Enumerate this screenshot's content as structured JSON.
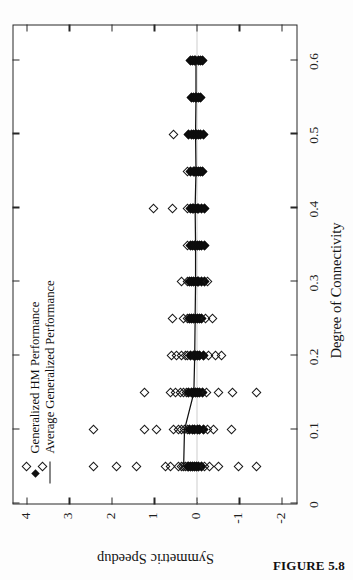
{
  "figure": {
    "caption": "FIGURE 5.8",
    "rotation_degrees": -90
  },
  "chart_data": {
    "type": "scatter",
    "title": "",
    "xlabel": "Degree of Connectivity",
    "ylabel": "Symmetric Speedup",
    "xlim": [
      0,
      0.65
    ],
    "ylim": [
      -2.4,
      4.3
    ],
    "xticks": [
      0,
      0.1,
      0.2,
      0.3,
      0.4,
      0.5,
      0.6
    ],
    "xtick_labels": [
      "0",
      "0.1",
      "0.2",
      "0.3",
      "0.4",
      "0.5",
      "0.6"
    ],
    "yticks": [
      4,
      3,
      2,
      1,
      0,
      -1,
      -2
    ],
    "ytick_labels": [
      "4",
      "3",
      "2",
      "1",
      "0",
      "-1",
      "-2"
    ],
    "grid": false,
    "zero_reference_line": true,
    "legend_position": "top-left",
    "legend": [
      {
        "name": "Generalized HM Performance",
        "marker": "diamond"
      },
      {
        "name": "Average Generalized Performance",
        "marker": "line"
      }
    ],
    "series": [
      {
        "name": "Generalized HM Performance",
        "marker": "diamond",
        "points": [
          [
            0.05,
            4.0
          ],
          [
            0.05,
            3.62
          ],
          [
            0.05,
            2.42
          ],
          [
            0.05,
            1.88
          ],
          [
            0.05,
            1.4
          ],
          [
            0.05,
            0.72
          ],
          [
            0.05,
            0.6
          ],
          [
            0.05,
            0.42
          ],
          [
            0.05,
            0.36
          ],
          [
            0.05,
            0.3
          ],
          [
            0.05,
            0.26
          ],
          [
            0.05,
            0.22
          ],
          [
            0.05,
            0.18
          ],
          [
            0.05,
            0.14
          ],
          [
            0.05,
            0.1
          ],
          [
            0.05,
            0.05
          ],
          [
            0.05,
            0.0
          ],
          [
            0.05,
            -0.05
          ],
          [
            0.05,
            -0.12
          ],
          [
            0.05,
            -0.2
          ],
          [
            0.05,
            -0.3
          ],
          [
            0.05,
            -0.52
          ],
          [
            0.05,
            -0.98
          ],
          [
            0.05,
            -1.42
          ],
          [
            0.1,
            2.42
          ],
          [
            0.1,
            1.22
          ],
          [
            0.1,
            0.94
          ],
          [
            0.1,
            0.55
          ],
          [
            0.1,
            0.42
          ],
          [
            0.1,
            0.34
          ],
          [
            0.1,
            0.28
          ],
          [
            0.1,
            0.22
          ],
          [
            0.1,
            0.16
          ],
          [
            0.1,
            0.1
          ],
          [
            0.1,
            0.04
          ],
          [
            0.1,
            -0.02
          ],
          [
            0.1,
            -0.08
          ],
          [
            0.1,
            -0.16
          ],
          [
            0.1,
            -0.26
          ],
          [
            0.1,
            -0.4
          ],
          [
            0.1,
            -0.82
          ],
          [
            0.15,
            1.22
          ],
          [
            0.15,
            0.62
          ],
          [
            0.15,
            0.5
          ],
          [
            0.15,
            0.38
          ],
          [
            0.15,
            0.3
          ],
          [
            0.15,
            0.24
          ],
          [
            0.15,
            0.18
          ],
          [
            0.15,
            0.12
          ],
          [
            0.15,
            0.06
          ],
          [
            0.15,
            0.02
          ],
          [
            0.15,
            -0.02
          ],
          [
            0.15,
            -0.08
          ],
          [
            0.15,
            -0.14
          ],
          [
            0.15,
            -0.24
          ],
          [
            0.15,
            -0.52
          ],
          [
            0.15,
            -0.86
          ],
          [
            0.15,
            -1.42
          ],
          [
            0.2,
            0.58
          ],
          [
            0.2,
            0.46
          ],
          [
            0.2,
            0.34
          ],
          [
            0.2,
            0.26
          ],
          [
            0.2,
            0.2
          ],
          [
            0.2,
            0.14
          ],
          [
            0.2,
            0.08
          ],
          [
            0.2,
            0.03
          ],
          [
            0.2,
            -0.02
          ],
          [
            0.2,
            -0.08
          ],
          [
            0.2,
            -0.16
          ],
          [
            0.2,
            -0.28
          ],
          [
            0.2,
            -0.44
          ],
          [
            0.2,
            -0.58
          ],
          [
            0.25,
            0.56
          ],
          [
            0.25,
            0.3
          ],
          [
            0.25,
            0.22
          ],
          [
            0.25,
            0.16
          ],
          [
            0.25,
            0.11
          ],
          [
            0.25,
            0.06
          ],
          [
            0.25,
            0.02
          ],
          [
            0.25,
            -0.02
          ],
          [
            0.25,
            -0.07
          ],
          [
            0.25,
            -0.13
          ],
          [
            0.25,
            -0.22
          ],
          [
            0.25,
            -0.38
          ],
          [
            0.3,
            0.36
          ],
          [
            0.3,
            0.22
          ],
          [
            0.3,
            0.16
          ],
          [
            0.3,
            0.11
          ],
          [
            0.3,
            0.06
          ],
          [
            0.3,
            0.02
          ],
          [
            0.3,
            -0.02
          ],
          [
            0.3,
            -0.06
          ],
          [
            0.3,
            -0.12
          ],
          [
            0.3,
            -0.18
          ],
          [
            0.3,
            -0.26
          ],
          [
            0.35,
            0.22
          ],
          [
            0.35,
            0.14
          ],
          [
            0.35,
            0.09
          ],
          [
            0.35,
            0.05
          ],
          [
            0.35,
            0.01
          ],
          [
            0.35,
            -0.03
          ],
          [
            0.35,
            -0.07
          ],
          [
            0.35,
            -0.12
          ],
          [
            0.35,
            -0.18
          ],
          [
            0.4,
            1.02
          ],
          [
            0.4,
            0.56
          ],
          [
            0.4,
            0.22
          ],
          [
            0.4,
            0.15
          ],
          [
            0.4,
            0.1
          ],
          [
            0.4,
            0.06
          ],
          [
            0.4,
            0.02
          ],
          [
            0.4,
            -0.02
          ],
          [
            0.4,
            -0.06
          ],
          [
            0.4,
            -0.11
          ],
          [
            0.4,
            -0.18
          ],
          [
            0.45,
            0.2
          ],
          [
            0.45,
            0.13
          ],
          [
            0.45,
            0.08
          ],
          [
            0.45,
            0.04
          ],
          [
            0.45,
            0.0
          ],
          [
            0.45,
            -0.04
          ],
          [
            0.45,
            -0.09
          ],
          [
            0.45,
            -0.14
          ],
          [
            0.5,
            0.55
          ],
          [
            0.5,
            0.18
          ],
          [
            0.5,
            0.12
          ],
          [
            0.5,
            0.07
          ],
          [
            0.5,
            0.03
          ],
          [
            0.5,
            -0.01
          ],
          [
            0.5,
            -0.05
          ],
          [
            0.5,
            -0.1
          ],
          [
            0.5,
            -0.16
          ],
          [
            0.55,
            0.12
          ],
          [
            0.55,
            0.07
          ],
          [
            0.55,
            0.03
          ],
          [
            0.55,
            -0.01
          ],
          [
            0.55,
            -0.05
          ],
          [
            0.55,
            -0.1
          ],
          [
            0.6,
            0.14
          ],
          [
            0.6,
            0.09
          ],
          [
            0.6,
            0.05
          ],
          [
            0.6,
            0.01
          ],
          [
            0.6,
            -0.04
          ],
          [
            0.6,
            -0.09
          ],
          [
            0.6,
            -0.14
          ]
        ]
      },
      {
        "name": "Average Generalized Performance",
        "marker": "line",
        "x": [
          0.05,
          0.1,
          0.15,
          0.2,
          0.25,
          0.3,
          0.35,
          0.4,
          0.45,
          0.5,
          0.55,
          0.6
        ],
        "values": [
          0.3,
          0.28,
          0.06,
          0.04,
          0.03,
          0.02,
          0.02,
          0.03,
          0.01,
          0.02,
          0.01,
          0.01
        ]
      }
    ]
  }
}
